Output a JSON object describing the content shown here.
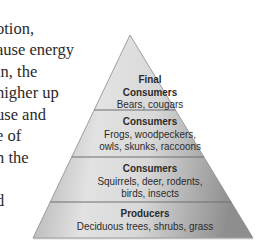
{
  "passage": {
    "lines": [
      "",
      "otion,",
      "ause energy",
      "in, the",
      "higher up",
      " use and",
      "e of",
      "n the",
      "",
      "d"
    ]
  },
  "figure": {
    "type": "energy-pyramid",
    "levels": [
      {
        "title_line1": "Final",
        "title_line2": "Consumers",
        "examples": "Bears, cougars"
      },
      {
        "title": "Consumers",
        "examples_line1": "Frogs, woodpeckers,",
        "examples_line2": "owls, skunks, raccoons"
      },
      {
        "title": "Consumers",
        "examples_line1": "Squirrels, deer, rodents,",
        "examples_line2": "birds, insects"
      },
      {
        "title": "Producers",
        "examples": "Deciduous trees, shrubs, grass"
      }
    ],
    "colors": {
      "band_light": "#dedede",
      "band_dark": "#9a9a9a",
      "divider": "#6e6e6e",
      "text": "#2b2b2b"
    }
  }
}
